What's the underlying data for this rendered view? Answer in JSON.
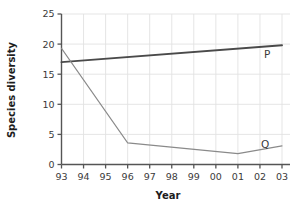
{
  "chart_data": {
    "type": "line",
    "title": "",
    "xlabel": "Year",
    "ylabel": "Species diversity",
    "x": [
      "93",
      "94",
      "95",
      "96",
      "97",
      "98",
      "99",
      "00",
      "01",
      "02",
      "03"
    ],
    "xlim": [
      1993,
      2003
    ],
    "ylim": [
      0,
      25
    ],
    "yticks": [
      0,
      5,
      10,
      15,
      20,
      25
    ],
    "xticks": [
      "93",
      "94",
      "95",
      "96",
      "97",
      "98",
      "99",
      "00",
      "01",
      "02",
      "03"
    ],
    "grid": true,
    "legend_position": "inline-end-of-line",
    "series": [
      {
        "name": "P",
        "label": "P",
        "color": "#4a4a4a",
        "width": 1.9,
        "x": [
          "93",
          "03"
        ],
        "values": [
          17.0,
          19.8
        ]
      },
      {
        "name": "Q",
        "label": "Q",
        "color": "#8a8a8a",
        "width": 1.1,
        "x": [
          "93",
          "96",
          "01",
          "03"
        ],
        "values": [
          19.3,
          3.6,
          1.8,
          3.1
        ]
      }
    ]
  },
  "axes": {
    "y_tick_labels": [
      "0",
      "5",
      "10",
      "15",
      "20",
      "25"
    ],
    "x_tick_labels": [
      "93",
      "94",
      "95",
      "96",
      "97",
      "98",
      "99",
      "00",
      "01",
      "02",
      "03"
    ],
    "y_axis_title": "Species diversity",
    "x_axis_title": "Year"
  },
  "labels": {
    "series_p": "P",
    "series_q": "Q"
  },
  "colors": {
    "axis": "#555555",
    "grid": "#e2e2e2",
    "series_p": "#4a4a4a",
    "series_q": "#8a8a8a",
    "text": "#3a3a3a",
    "background": "#ffffff"
  }
}
